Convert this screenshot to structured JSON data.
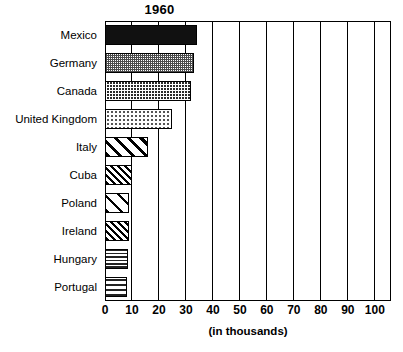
{
  "chart_data": {
    "type": "bar",
    "orientation": "horizontal",
    "title": "1960",
    "xlabel": "(in thousands)",
    "ylabel": "",
    "categories": [
      "Mexico",
      "Germany",
      "Canada",
      "United Kingdom",
      "Italy",
      "Cuba",
      "Poland",
      "Ireland",
      "Hungary",
      "Portugal"
    ],
    "values": [
      34,
      33,
      32,
      25,
      16,
      10,
      9,
      9,
      8.5,
      8
    ],
    "series": [
      {
        "name": "1960",
        "values": [
          34,
          33,
          32,
          25,
          16,
          10,
          9,
          9,
          8.5,
          8
        ]
      }
    ],
    "xlim": [
      0,
      106
    ],
    "xticks": [
      "0",
      "10",
      "20",
      "30",
      "40",
      "50",
      "60",
      "70",
      "80",
      "90",
      "100"
    ],
    "xtick_values": [
      0,
      10,
      20,
      30,
      40,
      50,
      60,
      70,
      80,
      90,
      100
    ],
    "grid": "vertical",
    "legend": "none",
    "bar_patterns": [
      "solid-black",
      "fine-checker-gray",
      "dark-checker",
      "light-dots",
      "wide-diagonal",
      "dense-diagonal",
      "sparse-diagonal",
      "dense-diagonal",
      "dense-horizontal",
      "sparse-horizontal"
    ],
    "colors": {
      "frame": "#000000",
      "background": "#ffffff",
      "bar_outline": "#000000",
      "solid_bar": "#111111"
    }
  },
  "axis": {
    "caption": "(in thousands)"
  }
}
